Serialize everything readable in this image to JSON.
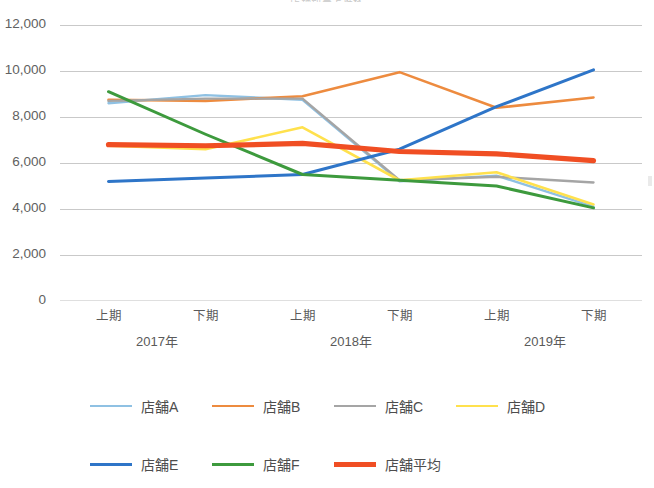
{
  "chart_title": "店舗別売上推移",
  "axis": {
    "y_ticks": [
      "12,000",
      "10,000",
      "8,000",
      "6,000",
      "4,000",
      "2,000",
      "0"
    ],
    "x_ticks": [
      "上期",
      "下期",
      "上期",
      "下期",
      "上期",
      "下期"
    ],
    "x_groups": [
      "2017年",
      "2018年",
      "2019年"
    ]
  },
  "legend": {
    "items": [
      {
        "label": "店舗A",
        "color": "#8FC1E3",
        "width": 2.4
      },
      {
        "label": "店舗B",
        "color": "#ED8B3F",
        "width": 2.6
      },
      {
        "label": "店舗C",
        "color": "#A5A5A5",
        "width": 2.4
      },
      {
        "label": "店舗D",
        "color": "#FFE14D",
        "width": 2.6
      },
      {
        "label": "店舗E",
        "color": "#2E75C8",
        "width": 3.0
      },
      {
        "label": "店舗F",
        "color": "#3D9A3D",
        "width": 3.0
      },
      {
        "label": "店舗平均",
        "color": "#F04E23",
        "width": 5.2
      }
    ]
  },
  "chart_data": {
    "type": "line",
    "title": "店舗別売上推移",
    "xlabel": "",
    "ylabel": "",
    "categories": [
      "2017年 上期",
      "2017年 下期",
      "2018年 上期",
      "2018年 下期",
      "2019年 上期",
      "2019年 下期"
    ],
    "tick_labels": [
      "上期",
      "下期",
      "上期",
      "下期",
      "上期",
      "下期"
    ],
    "group_labels": [
      "2017年",
      "2018年",
      "2019年"
    ],
    "ylim": [
      0,
      12000
    ],
    "ytick_values": [
      0,
      2000,
      4000,
      6000,
      8000,
      10000,
      12000
    ],
    "grid": "horizontal",
    "legend_position": "bottom",
    "series": [
      {
        "name": "店舗A",
        "color": "#8FC1E3",
        "width": 2.4,
        "values": [
          8600,
          8950,
          8750,
          5200,
          5450,
          4100
        ]
      },
      {
        "name": "店舗B",
        "color": "#ED8B3F",
        "width": 2.6,
        "values": [
          8750,
          8700,
          8900,
          9950,
          8400,
          8850
        ]
      },
      {
        "name": "店舗C",
        "color": "#A5A5A5",
        "width": 2.4,
        "values": [
          8700,
          8800,
          8800,
          5250,
          5400,
          5150
        ]
      },
      {
        "name": "店舗D",
        "color": "#FFE14D",
        "width": 2.6,
        "values": [
          6750,
          6600,
          7550,
          5250,
          5600,
          4200
        ]
      },
      {
        "name": "店舗E",
        "color": "#2E75C8",
        "width": 3.0,
        "values": [
          5200,
          5350,
          5500,
          6600,
          8450,
          10050
        ]
      },
      {
        "name": "店舗F",
        "color": "#3D9A3D",
        "width": 3.0,
        "values": [
          9100,
          7250,
          5500,
          5250,
          5000,
          4050
        ]
      },
      {
        "name": "店舗平均",
        "color": "#F04E23",
        "width": 5.2,
        "values": [
          6800,
          6750,
          6850,
          6500,
          6400,
          6100
        ]
      }
    ]
  }
}
